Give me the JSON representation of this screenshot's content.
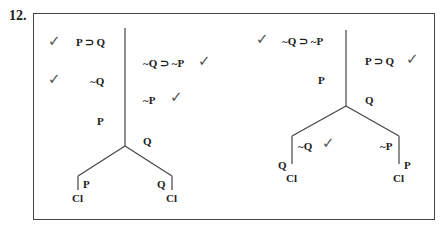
{
  "problem_number": "12.",
  "left_tree": {
    "premises": [
      {
        "text": "P ⊃ Q",
        "checked": true
      },
      {
        "text": "~Q",
        "checked": true
      },
      {
        "text": "P",
        "checked": false
      }
    ],
    "right_column": [
      {
        "text": "~Q ⊃ ~P",
        "checked": true
      },
      {
        "text": "~P",
        "checked": true
      },
      {
        "text": "Q",
        "checked": false
      }
    ],
    "branches": [
      {
        "node": "P",
        "close": "Cl"
      },
      {
        "node": "Q",
        "close": "Cl"
      }
    ]
  },
  "right_tree": {
    "premises": [
      {
        "text": "~Q ⊃ ~P",
        "checked": true
      },
      {
        "text": "P",
        "checked": false
      }
    ],
    "right_column": [
      {
        "text": "P ⊃ Q",
        "checked": true
      },
      {
        "text": "Q",
        "checked": false
      }
    ],
    "branches": [
      {
        "node": "~Q",
        "checked": true,
        "side_label": "Q",
        "close": "Cl"
      },
      {
        "node": "~P",
        "side_label": "P",
        "close": "Cl"
      }
    ]
  },
  "check_glyph": "✓"
}
